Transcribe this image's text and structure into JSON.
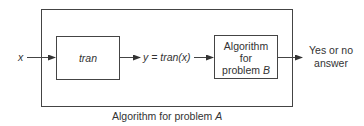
{
  "diagram": {
    "outer_box": {
      "caption_prefix": "Algorithm for problem ",
      "caption_var": "A"
    },
    "input_label": "x",
    "tran_box": {
      "label": "tran"
    },
    "intermediate_label": "y = tran(x)",
    "b_box": {
      "line1": "Algorithm",
      "line2": "for",
      "line3_prefix": "problem ",
      "line3_var": "B"
    },
    "output_label": {
      "line1": "Yes or no",
      "line2": "answer"
    },
    "colors": {
      "stroke": "#444444",
      "text": "#333333",
      "background": "#ffffff"
    }
  }
}
